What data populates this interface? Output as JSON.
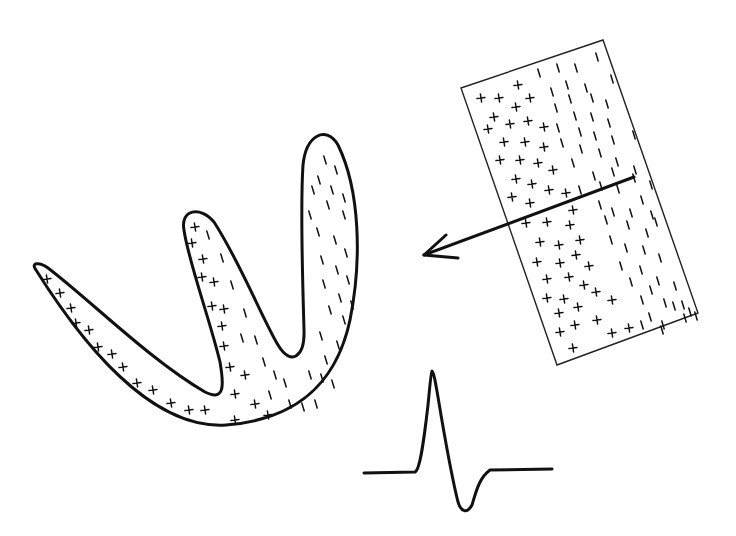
{
  "figure": {
    "colors": {
      "stroke": "#111111",
      "background": "#ffffff"
    }
  },
  "heart_shape": {
    "path": "M36,270 C30,262 40,262 48,268 C90,300 150,360 205,392 C225,402 224,385 220,362 C210,320 188,260 184,230 C180,210 200,205 214,222 C240,262 262,318 278,345 C292,368 305,355 304,330 C303,290 300,210 303,165 C306,135 326,125 338,145 C360,190 362,260 350,320 C335,390 290,420 226,425 C150,430 80,340 36,270 Z",
    "plus_marks": [
      [
        47,
        279
      ],
      [
        60,
        293
      ],
      [
        71,
        308
      ],
      [
        76,
        323
      ],
      [
        89,
        330
      ],
      [
        98,
        347
      ],
      [
        112,
        354
      ],
      [
        123,
        367
      ],
      [
        137,
        383
      ],
      [
        153,
        390
      ],
      [
        171,
        403
      ],
      [
        189,
        410
      ],
      [
        205,
        410
      ],
      [
        195,
        227
      ],
      [
        192,
        243
      ],
      [
        203,
        259
      ],
      [
        202,
        277
      ],
      [
        214,
        282
      ],
      [
        212,
        306
      ],
      [
        224,
        309
      ],
      [
        222,
        326
      ],
      [
        224,
        346
      ],
      [
        230,
        367
      ],
      [
        245,
        375
      ],
      [
        235,
        394
      ],
      [
        255,
        404
      ],
      [
        268,
        415
      ],
      [
        235,
        420
      ]
    ],
    "minus_marks": [
      [
        208,
        235
      ],
      [
        222,
        258
      ],
      [
        232,
        285
      ],
      [
        245,
        313
      ],
      [
        256,
        340
      ],
      [
        242,
        338
      ],
      [
        264,
        362
      ],
      [
        275,
        375
      ],
      [
        285,
        383
      ],
      [
        270,
        395
      ],
      [
        290,
        404
      ],
      [
        303,
        407
      ],
      [
        316,
        404
      ],
      [
        322,
        378
      ],
      [
        333,
        384
      ],
      [
        325,
        160
      ],
      [
        336,
        170
      ],
      [
        319,
        180
      ],
      [
        332,
        190
      ],
      [
        344,
        198
      ],
      [
        313,
        190
      ],
      [
        310,
        215
      ],
      [
        328,
        205
      ],
      [
        344,
        215
      ],
      [
        318,
        232
      ],
      [
        335,
        240
      ],
      [
        346,
        253
      ],
      [
        322,
        260
      ],
      [
        337,
        270
      ],
      [
        348,
        280
      ],
      [
        324,
        284
      ],
      [
        340,
        298
      ],
      [
        352,
        305
      ],
      [
        330,
        310
      ],
      [
        344,
        320
      ],
      [
        321,
        336
      ],
      [
        338,
        345
      ],
      [
        326,
        360
      ],
      [
        310,
        375
      ]
    ]
  },
  "tissue_block": {
    "corners": [
      [
        461,
        88
      ],
      [
        603,
        40
      ],
      [
        698,
        313
      ],
      [
        557,
        365
      ]
    ],
    "plus_marks": [
      [
        518,
        85
      ],
      [
        481,
        98
      ],
      [
        499,
        98
      ],
      [
        530,
        98
      ],
      [
        516,
        107
      ],
      [
        494,
        117
      ],
      [
        528,
        121
      ],
      [
        488,
        129
      ],
      [
        510,
        124
      ],
      [
        544,
        127
      ],
      [
        504,
        142
      ],
      [
        525,
        142
      ],
      [
        544,
        147
      ],
      [
        500,
        160
      ],
      [
        520,
        160
      ],
      [
        538,
        163
      ],
      [
        553,
        170
      ],
      [
        516,
        179
      ],
      [
        532,
        184
      ],
      [
        549,
        190
      ],
      [
        566,
        193
      ],
      [
        512,
        197
      ],
      [
        530,
        203
      ],
      [
        573,
        210
      ],
      [
        526,
        223
      ],
      [
        547,
        222
      ],
      [
        570,
        225
      ],
      [
        540,
        242
      ],
      [
        559,
        245
      ],
      [
        580,
        240
      ],
      [
        537,
        262
      ],
      [
        560,
        263
      ],
      [
        576,
        255
      ],
      [
        589,
        266
      ],
      [
        547,
        279
      ],
      [
        569,
        277
      ],
      [
        584,
        285
      ],
      [
        547,
        298
      ],
      [
        564,
        299
      ],
      [
        596,
        292
      ],
      [
        559,
        313
      ],
      [
        578,
        307
      ],
      [
        597,
        320
      ],
      [
        560,
        332
      ],
      [
        575,
        325
      ],
      [
        612,
        300
      ],
      [
        573,
        348
      ],
      [
        612,
        333
      ],
      [
        629,
        328
      ]
    ],
    "minus_marks": [
      [
        539,
        73
      ],
      [
        558,
        68
      ],
      [
        576,
        68
      ],
      [
        597,
        57
      ],
      [
        567,
        85
      ],
      [
        586,
        88
      ],
      [
        612,
        79
      ],
      [
        552,
        92
      ],
      [
        570,
        99
      ],
      [
        592,
        98
      ],
      [
        607,
        104
      ],
      [
        556,
        108
      ],
      [
        575,
        116
      ],
      [
        592,
        117
      ],
      [
        609,
        123
      ],
      [
        558,
        128
      ],
      [
        580,
        132
      ],
      [
        595,
        136
      ],
      [
        613,
        140
      ],
      [
        634,
        135
      ],
      [
        562,
        143
      ],
      [
        581,
        149
      ],
      [
        600,
        153
      ],
      [
        617,
        162
      ],
      [
        635,
        170
      ],
      [
        573,
        163
      ],
      [
        594,
        176
      ],
      [
        613,
        172
      ],
      [
        634,
        178
      ],
      [
        651,
        185
      ],
      [
        580,
        190
      ],
      [
        601,
        186
      ],
      [
        618,
        189
      ],
      [
        642,
        200
      ],
      [
        652,
        215
      ],
      [
        600,
        205
      ],
      [
        613,
        212
      ],
      [
        631,
        213
      ],
      [
        656,
        222
      ],
      [
        606,
        220
      ],
      [
        628,
        225
      ],
      [
        647,
        233
      ],
      [
        611,
        240
      ],
      [
        626,
        248
      ],
      [
        644,
        250
      ],
      [
        660,
        258
      ],
      [
        621,
        266
      ],
      [
        641,
        270
      ],
      [
        658,
        281
      ],
      [
        631,
        282
      ],
      [
        651,
        290
      ],
      [
        675,
        286
      ],
      [
        642,
        300
      ],
      [
        665,
        303
      ],
      [
        683,
        305
      ],
      [
        696,
        316
      ],
      [
        650,
        317
      ],
      [
        674,
        306
      ],
      [
        690,
        312
      ],
      [
        663,
        325
      ],
      [
        685,
        318
      ],
      [
        642,
        325
      ],
      [
        662,
        330
      ]
    ]
  },
  "arrow": {
    "start": [
      634,
      177
    ],
    "end": [
      424,
      255
    ],
    "head": [
      [
        446,
        235
      ],
      [
        424,
        255
      ],
      [
        458,
        258
      ]
    ]
  },
  "waveform": {
    "points": "M364,473 L415,472 C420,470 424,440 428,405 C430,385 431,372 432,371 C434,372 436,385 441,415 C447,450 453,482 458,502 C461,512 467,514 472,505 C476,492 479,478 490,470 L552,469"
  }
}
